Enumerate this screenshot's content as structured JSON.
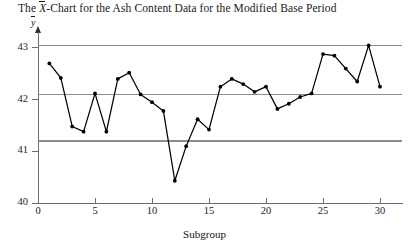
{
  "chart_data": {
    "type": "line",
    "title_prefix": "The ",
    "title_xbar": "X",
    "title_suffix": "-Chart for the Ash Content Data for the Modified Base Period",
    "xlabel": "Subgroup",
    "ylabel": "y",
    "ylabel_symbol": "y",
    "x": [
      1,
      2,
      3,
      4,
      5,
      6,
      7,
      8,
      9,
      10,
      11,
      12,
      13,
      14,
      15,
      16,
      17,
      18,
      19,
      20,
      21,
      22,
      23,
      24,
      25,
      26,
      27,
      28,
      29,
      30
    ],
    "values": [
      42.7,
      42.42,
      41.48,
      41.38,
      42.12,
      41.38,
      42.4,
      42.52,
      42.1,
      41.95,
      41.78,
      40.43,
      41.1,
      41.62,
      41.42,
      42.25,
      42.4,
      42.3,
      42.15,
      42.25,
      41.82,
      41.92,
      42.05,
      42.12,
      42.88,
      42.85,
      42.6,
      42.35,
      43.05,
      42.25
    ],
    "xlim": [
      0,
      32
    ],
    "ylim": [
      40,
      43.2
    ],
    "xticks": [
      0,
      5,
      10,
      15,
      20,
      25,
      30
    ],
    "yticks": [
      40,
      41,
      42,
      43
    ],
    "xtick_labels": [
      "0",
      "5",
      "10",
      "15",
      "20",
      "25",
      "30"
    ],
    "ytick_labels": [
      "40",
      "41",
      "42",
      "43"
    ],
    "grid": false,
    "legend": "none",
    "control_limits": {
      "ucl": 43.05,
      "center": 42.1,
      "lcl": 41.2,
      "ucl_label": "",
      "center_label": "",
      "lcl_label": ""
    },
    "colors": {
      "series": "#000000",
      "control_line": "#8c8c8c",
      "axis": "#6d6d6d",
      "background": "#ffffff",
      "text": "#1a1a1a"
    },
    "marker": "dot"
  }
}
